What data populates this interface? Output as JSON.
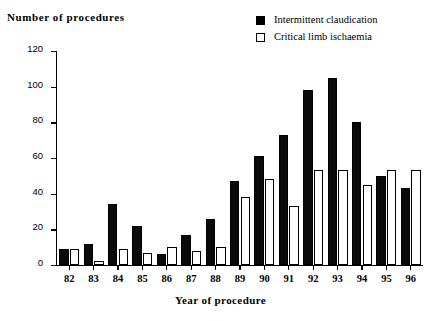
{
  "chart_data": {
    "type": "bar",
    "title": "",
    "xlabel": "Year of procedure",
    "ylabel": "Number of procedures",
    "categories": [
      "82",
      "83",
      "84",
      "85",
      "86",
      "87",
      "88",
      "89",
      "90",
      "91",
      "92",
      "93",
      "94",
      "95",
      "96"
    ],
    "series": [
      {
        "name": "Intermittent claudication",
        "color": "#000000",
        "style": "solid",
        "values": [
          9,
          12,
          34,
          22,
          6,
          17,
          26,
          47,
          61,
          73,
          98,
          105,
          80,
          50,
          43
        ]
      },
      {
        "name": "Critical limb ischaemia",
        "color": "#ffffff",
        "style": "hollow",
        "values": [
          9,
          2,
          9,
          7,
          10,
          8,
          10,
          38,
          48,
          33,
          53,
          53,
          45,
          53,
          53
        ]
      }
    ],
    "ylim": [
      0,
      120
    ],
    "yticks": [
      0,
      20,
      40,
      60,
      80,
      100,
      120
    ],
    "ytick_labels": [
      "0",
      "20",
      "40",
      "60",
      "80",
      "100",
      "120"
    ],
    "grid": false,
    "legend_position": "top-right"
  },
  "legend": {
    "items": [
      {
        "label": "Intermittent claudication",
        "swatch": "solid-square-icon"
      },
      {
        "label": "Critical limb ischaemia",
        "swatch": "hollow-square-icon"
      }
    ]
  },
  "axes": {
    "y_title": "Number of procedures",
    "x_title": "Year of procedure"
  }
}
